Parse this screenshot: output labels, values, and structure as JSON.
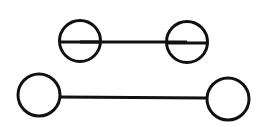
{
  "diagram": {
    "background": "#ffffff",
    "stroke_color": "#111111",
    "stroke_width": 3,
    "figures": [
      {
        "name": "top-figure",
        "line": {
          "x1": 80,
          "y1": 42,
          "x2": 187,
          "y2": 42
        },
        "circles": [
          {
            "cx": 80,
            "cy": 41,
            "r": 20.5,
            "diameter_line": true
          },
          {
            "cx": 187,
            "cy": 42,
            "r": 20.5,
            "diameter_line": true
          }
        ]
      },
      {
        "name": "bottom-figure",
        "line": {
          "x1": 60,
          "y1": 97,
          "x2": 207,
          "y2": 98
        },
        "circles": [
          {
            "cx": 39,
            "cy": 95,
            "r": 21,
            "diameter_line": false
          },
          {
            "cx": 228,
            "cy": 99,
            "r": 21,
            "diameter_line": false
          }
        ]
      }
    ]
  }
}
